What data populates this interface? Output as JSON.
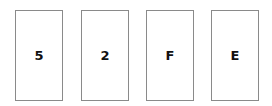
{
  "cards": [
    {
      "face": "5",
      "left": 15
    },
    {
      "face": "2",
      "left": 81
    },
    {
      "face": "F",
      "left": 146
    },
    {
      "face": "E",
      "left": 211
    }
  ]
}
